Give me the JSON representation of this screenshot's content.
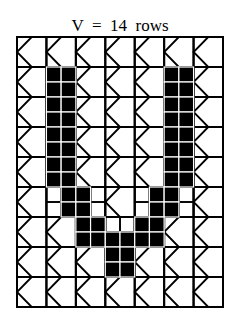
{
  "title": "V  =  14  rows",
  "letter": "V",
  "row_count_label": "14 rows",
  "grid": {
    "small_cols": 14,
    "small_rows": 18,
    "block_size": 2,
    "origin_x": 17,
    "origin_y": 37,
    "width": 206,
    "height": 270,
    "line_color": "#000000",
    "fill_color": "#000000",
    "fill_separator_color": "#ffffff"
  },
  "filled_cells": [
    [
      2,
      2
    ],
    [
      3,
      2
    ],
    [
      2,
      3
    ],
    [
      3,
      3
    ],
    [
      2,
      4
    ],
    [
      3,
      4
    ],
    [
      2,
      5
    ],
    [
      3,
      5
    ],
    [
      2,
      6
    ],
    [
      3,
      6
    ],
    [
      2,
      7
    ],
    [
      3,
      7
    ],
    [
      2,
      8
    ],
    [
      3,
      8
    ],
    [
      2,
      9
    ],
    [
      3,
      9
    ],
    [
      10,
      2
    ],
    [
      11,
      2
    ],
    [
      10,
      3
    ],
    [
      11,
      3
    ],
    [
      10,
      4
    ],
    [
      11,
      4
    ],
    [
      10,
      5
    ],
    [
      11,
      5
    ],
    [
      10,
      6
    ],
    [
      11,
      6
    ],
    [
      10,
      7
    ],
    [
      11,
      7
    ],
    [
      10,
      8
    ],
    [
      11,
      8
    ],
    [
      10,
      9
    ],
    [
      11,
      9
    ],
    [
      3,
      10
    ],
    [
      4,
      10
    ],
    [
      3,
      11
    ],
    [
      4,
      11
    ],
    [
      9,
      10
    ],
    [
      10,
      10
    ],
    [
      9,
      11
    ],
    [
      10,
      11
    ],
    [
      4,
      12
    ],
    [
      5,
      12
    ],
    [
      8,
      12
    ],
    [
      9,
      12
    ],
    [
      4,
      13
    ],
    [
      5,
      13
    ],
    [
      6,
      13
    ],
    [
      7,
      13
    ],
    [
      8,
      13
    ],
    [
      9,
      13
    ],
    [
      6,
      14
    ],
    [
      7,
      14
    ],
    [
      6,
      15
    ],
    [
      7,
      15
    ]
  ]
}
